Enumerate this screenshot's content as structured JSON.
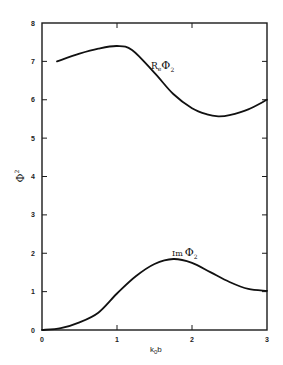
{
  "chart_data": {
    "type": "line",
    "title": "",
    "xlabel": "k_0 b",
    "ylabel": "Φ_2",
    "xlim": [
      0,
      3
    ],
    "ylim": [
      0,
      8
    ],
    "x_ticks": [
      "0",
      "1",
      "2",
      "3"
    ],
    "y_ticks": [
      "0",
      "1",
      "2",
      "3",
      "4",
      "5",
      "6",
      "7",
      "8"
    ],
    "grid": false,
    "legend": "none (inline curve labels)",
    "series": [
      {
        "name": "Re Φ2",
        "label_main": "R",
        "label_sub1": "e",
        "label_sym": "Φ",
        "label_sub2": "2",
        "x": [
          0.2,
          0.5,
          0.75,
          1.0,
          1.2,
          1.5,
          1.75,
          2.0,
          2.2,
          2.35,
          2.5,
          2.75,
          3.0
        ],
        "values": [
          7.0,
          7.2,
          7.33,
          7.4,
          7.3,
          6.7,
          6.15,
          5.78,
          5.62,
          5.57,
          5.6,
          5.75,
          6.0
        ]
      },
      {
        "name": "Im Φ2",
        "label_main": "Im",
        "label_sym": "Φ",
        "label_sub2": "2",
        "x": [
          0.0,
          0.25,
          0.5,
          0.75,
          1.0,
          1.25,
          1.5,
          1.75,
          2.0,
          2.25,
          2.5,
          2.75,
          3.0
        ],
        "values": [
          0.0,
          0.05,
          0.2,
          0.45,
          0.95,
          1.4,
          1.72,
          1.85,
          1.75,
          1.5,
          1.25,
          1.07,
          1.02
        ]
      }
    ]
  },
  "axes": {
    "xlabel_main": "k",
    "xlabel_sub": "0",
    "xlabel_tail": "b",
    "ylabel_sym": "Φ",
    "ylabel_sub": "2"
  }
}
